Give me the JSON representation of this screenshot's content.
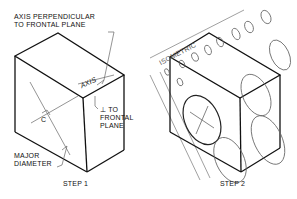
{
  "step1": {
    "label_axis_perp_line1": "AXIS PERPENDICULAR",
    "label_axis_perp_line2": "TO FRONTAL PLANE",
    "label_axis": "AXIS",
    "label_perp_line1": "⊥ TO",
    "label_perp_line2": "FRONTAL",
    "label_perp_line3": "PLANE",
    "label_c": "C",
    "label_major_line1": "MAJOR",
    "label_major_line2": "DIAMETER",
    "caption": "STEP 1"
  },
  "step2": {
    "label_isometric": "ISOMETRIC",
    "caption": "STEP 2"
  },
  "colors": {
    "line": "#111111",
    "thin": "#555555",
    "background": "#ffffff"
  }
}
